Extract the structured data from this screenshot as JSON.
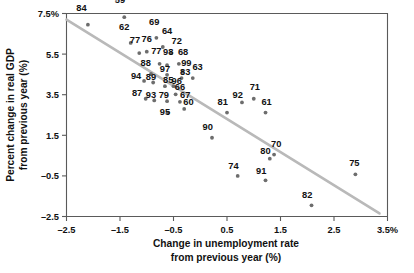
{
  "chart_data": {
    "type": "scatter",
    "title": "",
    "xlabel": "Change in unemployment rate from previous year (%)",
    "ylabel": "Percent change in real GDP from previous year (%)",
    "xlabel_lines": [
      "Change in unemployment rate",
      "from previous year (%)"
    ],
    "ylabel_lines": [
      "Percent change in real GDP",
      "from previous year (%)"
    ],
    "xlim": [
      -2.5,
      3.5
    ],
    "ylim": [
      -2.5,
      7.5
    ],
    "xticks": [
      -2.5,
      -1.5,
      -0.5,
      0.5,
      1.5,
      2.5,
      3.5
    ],
    "yticks": [
      -2.5,
      -0.5,
      1.5,
      3.5,
      5.5,
      7.5
    ],
    "xticklabels": [
      "–2.5",
      "–1.5",
      "–0.5",
      "0.5",
      "1.5",
      "2.5",
      "3.5%"
    ],
    "yticklabels": [
      "–2.5",
      "–0.5",
      "1.5",
      "3.5",
      "5.5",
      "7.5%"
    ],
    "grid": false,
    "legend": null,
    "point_color": "#6d6d6d",
    "trendline_color": "#b9b9b9",
    "trendline": {
      "x1": -2.5,
      "y1": 7.2,
      "x2": 3.35,
      "y2": -2.35
    },
    "label_field": "year",
    "points": [
      {
        "year": "84",
        "x": -2.1,
        "y": 6.95,
        "lx": -2.22,
        "ly": 7.62
      },
      {
        "year": "59",
        "x": -1.42,
        "y": 7.32,
        "lx": -1.5,
        "ly": 8.0
      },
      {
        "year": "62",
        "x": -1.3,
        "y": 6.05,
        "lx": -1.42,
        "ly": 6.7
      },
      {
        "year": "69",
        "x": -0.82,
        "y": 6.3,
        "lx": -0.86,
        "ly": 6.95
      },
      {
        "year": "64",
        "x": -0.7,
        "y": 5.85,
        "lx": -0.62,
        "ly": 6.48
      },
      {
        "year": "77",
        "x": -1.14,
        "y": 5.55,
        "lx": -1.22,
        "ly": 6.05
      },
      {
        "year": "76",
        "x": -1.0,
        "y": 5.62,
        "lx": -1.0,
        "ly": 6.1
      },
      {
        "year": "72",
        "x": -0.54,
        "y": 5.55,
        "lx": -0.44,
        "ly": 6.02
      },
      {
        "year": "77b",
        "x": -0.76,
        "y": 5.02,
        "lx": -0.82,
        "ly": 5.5
      },
      {
        "year": "98",
        "x": -0.62,
        "y": 4.95,
        "lx": -0.6,
        "ly": 5.46
      },
      {
        "year": "68",
        "x": -0.4,
        "y": 5.02,
        "lx": -0.32,
        "ly": 5.48
      },
      {
        "year": "88",
        "x": -0.92,
        "y": 4.52,
        "lx": -1.02,
        "ly": 4.9
      },
      {
        "year": "97",
        "x": -0.62,
        "y": 4.48,
        "lx": -0.66,
        "ly": 4.62
      },
      {
        "year": "99",
        "x": -0.33,
        "y": 4.62,
        "lx": -0.26,
        "ly": 4.92
      },
      {
        "year": "63",
        "x": -0.14,
        "y": 4.32,
        "lx": -0.05,
        "ly": 4.72
      },
      {
        "year": "83",
        "x": -0.35,
        "y": 4.32,
        "lx": -0.28,
        "ly": 4.48
      },
      {
        "year": "94",
        "x": -1.05,
        "y": 4.18,
        "lx": -1.2,
        "ly": 4.28
      },
      {
        "year": "89",
        "x": -0.88,
        "y": 4.1,
        "lx": -0.92,
        "ly": 4.22
      },
      {
        "year": "85",
        "x": -0.66,
        "y": 3.92,
        "lx": -0.6,
        "ly": 4.08
      },
      {
        "year": "96",
        "x": -0.5,
        "y": 3.92,
        "lx": -0.44,
        "ly": 4.05
      },
      {
        "year": "66",
        "x": -0.46,
        "y": 3.52,
        "lx": -0.38,
        "ly": 3.72
      },
      {
        "year": "87",
        "x": -1.02,
        "y": 3.3,
        "lx": -1.18,
        "ly": 3.42
      },
      {
        "year": "93",
        "x": -0.86,
        "y": 3.22,
        "lx": -0.92,
        "ly": 3.35
      },
      {
        "year": "79",
        "x": -0.62,
        "y": 3.18,
        "lx": -0.68,
        "ly": 3.35
      },
      {
        "year": "67",
        "x": -0.38,
        "y": 3.15,
        "lx": -0.28,
        "ly": 3.32
      },
      {
        "year": "60",
        "x": -0.3,
        "y": 2.8,
        "lx": -0.22,
        "ly": 2.98
      },
      {
        "year": "95",
        "x": -0.6,
        "y": 2.62,
        "lx": -0.66,
        "ly": 2.48
      },
      {
        "year": "81",
        "x": 0.5,
        "y": 2.62,
        "lx": 0.42,
        "ly": 2.98
      },
      {
        "year": "92",
        "x": 0.78,
        "y": 3.12,
        "lx": 0.7,
        "ly": 3.35
      },
      {
        "year": "71",
        "x": 1.0,
        "y": 3.3,
        "lx": 1.02,
        "ly": 3.72
      },
      {
        "year": "61",
        "x": 1.22,
        "y": 2.62,
        "lx": 1.24,
        "ly": 2.98
      },
      {
        "year": "90",
        "x": 0.22,
        "y": 1.38,
        "lx": 0.14,
        "ly": 1.78
      },
      {
        "year": "70",
        "x": 1.38,
        "y": 0.55,
        "lx": 1.42,
        "ly": 0.92
      },
      {
        "year": "80",
        "x": 1.3,
        "y": 0.35,
        "lx": 1.22,
        "ly": 0.6
      },
      {
        "year": "74",
        "x": 0.7,
        "y": -0.5,
        "lx": 0.62,
        "ly": -0.15
      },
      {
        "year": "91",
        "x": 1.22,
        "y": -0.72,
        "lx": 1.14,
        "ly": -0.42
      },
      {
        "year": "75",
        "x": 2.9,
        "y": -0.42,
        "lx": 2.88,
        "ly": 0.0
      },
      {
        "year": "82",
        "x": 2.08,
        "y": -1.95,
        "lx": 2.0,
        "ly": -1.58
      }
    ]
  }
}
